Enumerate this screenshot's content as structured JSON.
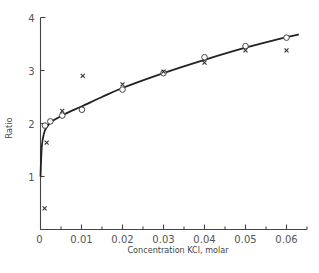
{
  "chart_data": {
    "type": "scatter",
    "title": "",
    "xlabel": "Concentration KCl, molar",
    "ylabel": "Ratio",
    "xlim": [
      0,
      0.065
    ],
    "ylim": [
      0,
      4
    ],
    "x_ticks": [
      "0",
      "0.01",
      "0.02",
      "0.03",
      "0.04",
      "0.05",
      "0.06"
    ],
    "y_ticks": [
      "1",
      "2",
      "3",
      "4"
    ],
    "grid": false,
    "legend": null,
    "series": [
      {
        "name": "circles",
        "marker": "o",
        "x": [
          0.0011,
          0.0024,
          0.0053,
          0.0101,
          0.02,
          0.03,
          0.04,
          0.05,
          0.06
        ],
        "y": [
          1.96,
          2.04,
          2.15,
          2.26,
          2.64,
          2.95,
          3.25,
          3.46,
          3.62
        ]
      },
      {
        "name": "crosses",
        "marker": "x",
        "x": [
          0.001,
          0.0015,
          0.0053,
          0.0103,
          0.02,
          0.03,
          0.04,
          0.05,
          0.06
        ],
        "y": [
          0.4,
          1.64,
          2.24,
          2.9,
          2.74,
          2.98,
          3.15,
          3.38,
          3.38
        ]
      },
      {
        "name": "fitted-curve",
        "marker": "line",
        "x": [
          0.0,
          0.0003,
          0.0008,
          0.0015,
          0.003,
          0.006,
          0.01,
          0.015,
          0.02,
          0.03,
          0.04,
          0.05,
          0.06,
          0.063
        ],
        "y": [
          1.0,
          1.55,
          1.8,
          1.93,
          2.05,
          2.18,
          2.32,
          2.5,
          2.67,
          2.95,
          3.2,
          3.43,
          3.63,
          3.68
        ]
      }
    ]
  },
  "labels": {
    "ylabel": "Ratio",
    "xlabel": "Concentration KCl, molar",
    "origin": "0"
  }
}
